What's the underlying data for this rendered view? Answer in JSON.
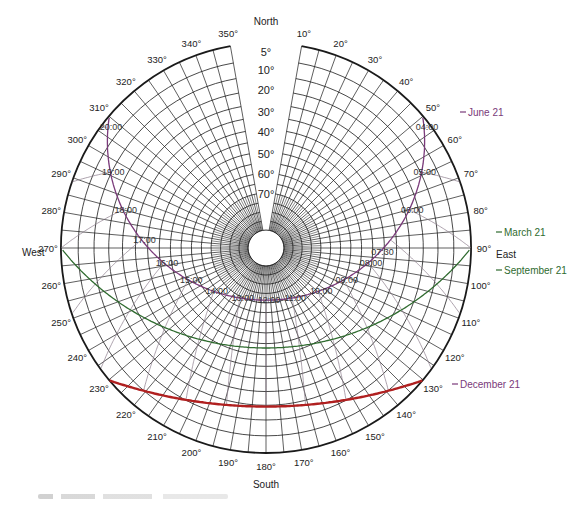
{
  "diagram": {
    "type": "sun-path-diagram",
    "projection": "stereographic-polar",
    "cardinals": {
      "north": "North",
      "south": "South",
      "east": "East",
      "west": "West"
    },
    "azimuth_labels": [
      "10°",
      "20°",
      "30°",
      "40°",
      "50°",
      "60°",
      "70°",
      "80°",
      "90°",
      "100°",
      "110°",
      "120°",
      "130°",
      "140°",
      "150°",
      "160°",
      "170°",
      "180°",
      "190°",
      "200°",
      "210°",
      "220°",
      "230°",
      "240°",
      "250°",
      "260°",
      "270°",
      "280°",
      "290°",
      "300°",
      "310°",
      "320°",
      "330°",
      "340°",
      "350°"
    ],
    "azimuth_values": [
      10,
      20,
      30,
      40,
      50,
      60,
      70,
      80,
      90,
      100,
      110,
      120,
      130,
      140,
      150,
      160,
      170,
      180,
      190,
      200,
      210,
      220,
      230,
      240,
      250,
      260,
      270,
      280,
      290,
      300,
      310,
      320,
      330,
      340,
      350
    ],
    "altitude_labels": [
      "5°",
      "10°",
      "20°",
      "30°",
      "40°",
      "50°",
      "60°",
      "70°"
    ],
    "altitude_values": [
      5,
      10,
      20,
      30,
      40,
      50,
      60,
      70
    ],
    "legend": [
      {
        "label": "June 21",
        "color": "#7a3a7a"
      },
      {
        "label": "March 21",
        "color": "#2f6b2f"
      },
      {
        "label": "September 21",
        "color": "#2f6b2f"
      },
      {
        "label": "December 21",
        "color": "#7a3a7a"
      }
    ],
    "hour_labels": {
      "june": [
        "04:00",
        "05:00",
        "06:00",
        "07:30",
        "08:00",
        "09:00",
        "10:00",
        "11:00",
        "12:00",
        "13:00",
        "14:00",
        "15:00",
        "16:00",
        "17:00",
        "18:00",
        "19:00",
        "20:00"
      ]
    },
    "colors": {
      "grid": "#1a1a1a",
      "june_curve": "#7a3a7a",
      "equinox_curve": "#2f6b2f",
      "december_curve": "#b02020",
      "hour_lines": "#8a7a8a"
    }
  }
}
